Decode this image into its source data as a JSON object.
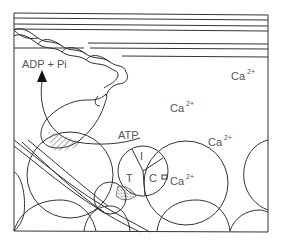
{
  "diagram": {
    "labels": {
      "adp_pi": "ADP + Pi",
      "atp": "ATP",
      "calcium": "Ca",
      "calcium_charge": "2+",
      "troponin_i": "I",
      "troponin_t": "T",
      "troponin_c": "C"
    },
    "calcium_ions": [
      {
        "x": 231,
        "y": 78
      },
      {
        "x": 157,
        "y": 110
      },
      {
        "x": 208,
        "y": 144
      },
      {
        "x": 170,
        "y": 185
      }
    ],
    "colors": {
      "line": "#333333",
      "text": "#555555",
      "background": "#ffffff"
    }
  }
}
